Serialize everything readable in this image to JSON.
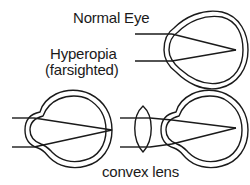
{
  "labels": {
    "normal_eye": "Normal Eye",
    "hyperopia": "Hyperopia",
    "farsighted": "(farsighted)",
    "convex_lens": "convex lens"
  },
  "colors": {
    "stroke": "#1a1a1a",
    "background": "#ffffff"
  },
  "figures": [
    {
      "name": "normal-eye",
      "focus": "on retina"
    },
    {
      "name": "hyperopic-eye",
      "focus": "behind retina"
    },
    {
      "name": "corrected-eye",
      "correction": "convex lens",
      "focus": "on retina"
    }
  ]
}
